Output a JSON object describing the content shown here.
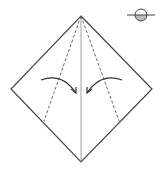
{
  "diagram": {
    "type": "origami-step",
    "colors": {
      "stroke": "#444444",
      "crease": "#777777",
      "background": "#ffffff",
      "paper_back": "#bbbbbb"
    },
    "shape": {
      "top": [
        81,
        16
      ],
      "right": [
        152,
        89
      ],
      "bottom": [
        81,
        162
      ],
      "left": [
        11,
        89
      ]
    },
    "center_crease": {
      "from": [
        81,
        16
      ],
      "to": [
        81,
        162
      ]
    },
    "valley_folds": [
      {
        "side": "left",
        "from": [
          81,
          16
        ],
        "to": [
          44,
          121
        ]
      },
      {
        "side": "right",
        "from": [
          81,
          16
        ],
        "to": [
          119,
          121
        ]
      }
    ],
    "arrows": [
      {
        "side": "left",
        "direction": "fold-right",
        "start": [
          41,
          80
        ],
        "end": [
          76,
          93
        ]
      },
      {
        "side": "right",
        "direction": "fold-left",
        "start": [
          122,
          80
        ],
        "end": [
          87,
          93
        ]
      }
    ],
    "symbol": {
      "name": "turn-over-symbol",
      "meaning": "flip / side indicator",
      "center": [
        141,
        15
      ],
      "radius": 6
    }
  }
}
